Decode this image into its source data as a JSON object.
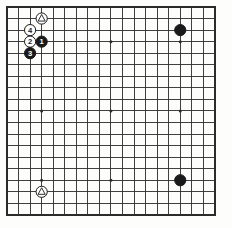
{
  "diagram": {
    "kind": "go-board-diagram",
    "caption": "",
    "board": {
      "size": 19,
      "cols": 19,
      "rows": 19,
      "origin_x": 7.0,
      "origin_y": 7.0,
      "spacing": 11.55,
      "line_color": "#2b2b2b",
      "line_width": 0.9,
      "border_width": 1.6,
      "background_color": "#fdfdfc",
      "star_point_radius": 1.5,
      "star_points": [
        {
          "col": 3,
          "row": 3
        },
        {
          "col": 9,
          "row": 3
        },
        {
          "col": 15,
          "row": 3
        },
        {
          "col": 3,
          "row": 9
        },
        {
          "col": 9,
          "row": 9
        },
        {
          "col": 15,
          "row": 9
        },
        {
          "col": 3,
          "row": 15
        },
        {
          "col": 9,
          "row": 15
        },
        {
          "col": 15,
          "row": 15
        }
      ]
    },
    "colors": {
      "black_stone": "#1a1a1a",
      "white_stone": "#ffffff",
      "stone_outline": "#1a1a1a",
      "black_label": "#ffffff",
      "white_label": "#1a1a1a",
      "grid": "#2b2b2b"
    },
    "stone_radius": 5.6,
    "stones": [
      {
        "id": "white-triangle-top",
        "col": 3,
        "row": 1,
        "color": "white",
        "label": "",
        "marker": "triangle",
        "name": "white-stone-marked-top"
      },
      {
        "id": "white-move-4",
        "col": 2,
        "row": 2,
        "color": "white",
        "label": "4",
        "marker": "",
        "name": "white-stone-move-4"
      },
      {
        "id": "white-move-2",
        "col": 2,
        "row": 3,
        "color": "white",
        "label": "2",
        "marker": "",
        "name": "white-stone-move-2"
      },
      {
        "id": "black-move-1",
        "col": 3,
        "row": 3,
        "color": "black",
        "label": "1",
        "marker": "",
        "name": "black-stone-move-1"
      },
      {
        "id": "black-move-3",
        "col": 2,
        "row": 4,
        "color": "black",
        "label": "3",
        "marker": "",
        "name": "black-stone-move-3"
      },
      {
        "id": "black-top-right",
        "col": 15,
        "row": 2,
        "color": "black",
        "label": "",
        "marker": "",
        "name": "black-stone-top-right"
      },
      {
        "id": "black-bottom-right",
        "col": 15,
        "row": 15,
        "color": "black",
        "label": "",
        "marker": "",
        "name": "black-stone-bottom-right"
      },
      {
        "id": "white-triangle-bottom",
        "col": 3,
        "row": 16,
        "color": "white",
        "label": "",
        "marker": "triangle",
        "name": "white-stone-marked-bottom"
      }
    ],
    "move_labels": [
      "1",
      "2",
      "3",
      "4"
    ]
  }
}
